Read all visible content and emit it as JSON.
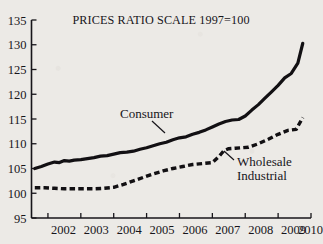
{
  "chart_data": {
    "type": "line",
    "title": "PRICES RATIO SCALE 1997=100",
    "xlabel": "",
    "ylabel": "",
    "xlim": [
      2001.5,
      2010.0
    ],
    "ylim": [
      95,
      135
    ],
    "yticks": [
      95,
      100,
      105,
      110,
      115,
      120,
      125,
      130,
      135
    ],
    "ytick_labels": [
      "95",
      "100",
      "105",
      "110",
      "115",
      "120",
      "125",
      "130",
      "135"
    ],
    "xticks": [
      2002,
      2003,
      2004,
      2005,
      2006,
      2007,
      2008,
      2009,
      2010
    ],
    "xtick_labels": [
      "2002",
      "2003",
      "2004",
      "2005",
      "2006",
      "2007",
      "2008",
      "2009",
      "2010"
    ],
    "grid": false,
    "legend_position": "inline-annotation",
    "reference_line": {
      "y": 100,
      "label": "100"
    },
    "series": [
      {
        "name": "Consumer",
        "style": "solid",
        "color": "#121013",
        "label_position": {
          "x": 2004.6,
          "y": 118.2
        },
        "x": [
          2001.6,
          2001.8,
          2002.0,
          2002.2,
          2002.35,
          2002.5,
          2002.65,
          2002.8,
          2003.0,
          2003.2,
          2003.4,
          2003.6,
          2003.8,
          2004.0,
          2004.2,
          2004.4,
          2004.6,
          2004.8,
          2005.0,
          2005.2,
          2005.4,
          2005.6,
          2005.8,
          2006.0,
          2006.2,
          2006.4,
          2006.6,
          2006.8,
          2007.0,
          2007.2,
          2007.4,
          2007.6,
          2007.8,
          2008.0,
          2008.2,
          2008.4,
          2008.6,
          2008.8,
          2009.0,
          2009.2,
          2009.4,
          2009.6,
          2009.75
        ],
        "values": [
          105.0,
          105.4,
          105.9,
          106.3,
          106.2,
          106.6,
          106.5,
          106.7,
          106.8,
          107.0,
          107.2,
          107.5,
          107.6,
          107.9,
          108.2,
          108.3,
          108.5,
          108.9,
          109.2,
          109.6,
          110.0,
          110.3,
          110.8,
          111.2,
          111.4,
          111.9,
          112.3,
          112.8,
          113.4,
          114.0,
          114.5,
          114.8,
          114.9,
          115.6,
          116.8,
          117.9,
          119.2,
          120.5,
          121.8,
          123.3,
          124.2,
          126.3,
          130.3
        ]
      },
      {
        "name": "Wholesale Industrial",
        "style": "dashed",
        "color": "#121013",
        "label_position": {
          "x": 2008.15,
          "y": 105.6
        },
        "x": [
          2001.6,
          2001.9,
          2002.2,
          2002.5,
          2002.8,
          2003.1,
          2003.4,
          2003.7,
          2004.0,
          2004.3,
          2004.6,
          2004.9,
          2005.2,
          2005.5,
          2005.8,
          2006.1,
          2006.4,
          2006.7,
          2007.0,
          2007.2,
          2007.35,
          2007.5,
          2007.7,
          2007.9,
          2008.1,
          2008.4,
          2008.7,
          2009.0,
          2009.3,
          2009.55,
          2009.75
        ],
        "values": [
          101.1,
          101.1,
          101.0,
          100.9,
          100.9,
          100.9,
          100.9,
          101.0,
          101.2,
          101.8,
          102.5,
          103.2,
          103.9,
          104.5,
          105.0,
          105.4,
          105.8,
          106.0,
          106.2,
          107.4,
          108.6,
          109.0,
          109.1,
          109.2,
          109.3,
          110.0,
          110.9,
          111.9,
          112.7,
          112.9,
          115.3
        ]
      }
    ],
    "annotations": [
      {
        "text": "Consumer",
        "lines": [
          "Consumer"
        ]
      },
      {
        "text": "Wholesale Industrial",
        "lines": [
          "Wholesale",
          "Industrial"
        ]
      }
    ]
  }
}
